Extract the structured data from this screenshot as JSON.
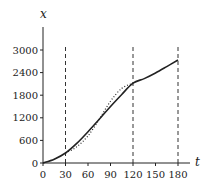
{
  "chart_data": {
    "type": "line",
    "title": "",
    "xlabel": "t",
    "ylabel": "x",
    "xlim": [
      0,
      180
    ],
    "ylim": [
      0,
      3000
    ],
    "x_ticks": [
      0,
      30,
      60,
      90,
      120,
      150,
      180
    ],
    "y_ticks": [
      0,
      600,
      1200,
      1800,
      2400,
      3000
    ],
    "grid": false,
    "legend": null,
    "vertical_dashed_lines": [
      30,
      120,
      180
    ],
    "series": [
      {
        "name": "solid",
        "style": "solid",
        "x": [
          0,
          15,
          30,
          45,
          60,
          75,
          90,
          105,
          120,
          135,
          150,
          165,
          180
        ],
        "values": [
          0,
          100,
          265,
          520,
          830,
          1160,
          1500,
          1820,
          2120,
          2240,
          2390,
          2560,
          2735
        ]
      },
      {
        "name": "dotted",
        "style": "dotted",
        "x": [
          30,
          45,
          60,
          75,
          90,
          105,
          120
        ],
        "values": [
          265,
          430,
          720,
          1160,
          1640,
          1980,
          2120
        ]
      }
    ]
  }
}
